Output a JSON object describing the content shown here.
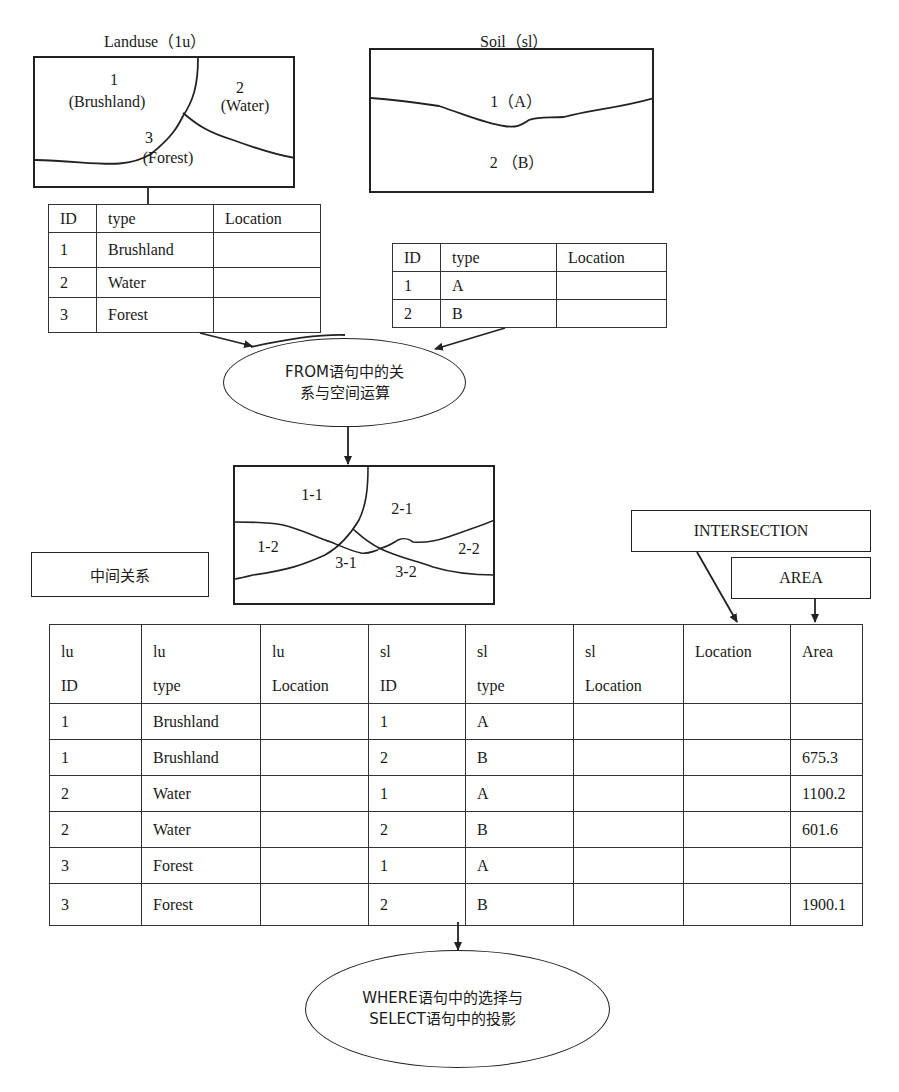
{
  "landuse": {
    "title": "Landuse（1u）",
    "regions": [
      {
        "id": "1",
        "name": "(Brushland)"
      },
      {
        "id": "2",
        "name": "(Water)"
      },
      {
        "id": "3",
        "name": "(Forest)"
      }
    ],
    "table": {
      "headers": [
        "ID",
        "type",
        "Location"
      ],
      "rows": [
        [
          "1",
          "Brushland",
          ""
        ],
        [
          "2",
          "Water",
          ""
        ],
        [
          "3",
          "Forest",
          ""
        ]
      ]
    }
  },
  "soil": {
    "title": "Soil（sl）",
    "regions": [
      {
        "label": "1（A）"
      },
      {
        "label": "2 （B）"
      }
    ],
    "table": {
      "headers": [
        "ID",
        "type",
        "Location"
      ],
      "rows": [
        [
          "1",
          "A",
          ""
        ],
        [
          "2",
          "B",
          ""
        ]
      ]
    }
  },
  "from_op": {
    "line1": "FROM语句中的关",
    "line2": "系与空间运算"
  },
  "overlay_map": {
    "regions": [
      "1-1",
      "2-1",
      "1-2",
      "3-1",
      "3-2",
      "2-2"
    ]
  },
  "intermediate_label": "中间关系",
  "intersection_label": "INTERSECTION",
  "area_label": "AREA",
  "result_table": {
    "headers": [
      [
        "lu",
        "ID"
      ],
      [
        "lu",
        "type"
      ],
      [
        "lu",
        "Location"
      ],
      [
        "sl",
        "ID"
      ],
      [
        "sl",
        "type"
      ],
      [
        "sl",
        "Location"
      ],
      [
        "Location",
        ""
      ],
      [
        "Area",
        ""
      ]
    ],
    "rows": [
      [
        "1",
        "Brushland",
        "",
        "1",
        "A",
        "",
        "",
        ""
      ],
      [
        "1",
        "Brushland",
        "",
        "2",
        "B",
        "",
        "",
        "675.3"
      ],
      [
        "2",
        "Water",
        "",
        "1",
        "A",
        "",
        "",
        "1100.2"
      ],
      [
        "2",
        "Water",
        "",
        "2",
        "B",
        "",
        "",
        "601.6"
      ],
      [
        "3",
        "Forest",
        "",
        "1",
        "A",
        "",
        "",
        ""
      ],
      [
        "3",
        "Forest",
        "",
        "2",
        "B",
        "",
        "",
        "1900.1"
      ]
    ]
  },
  "where_op": {
    "line1": "WHERE语句中的选择与",
    "line2": "SELECT语句中的投影"
  }
}
